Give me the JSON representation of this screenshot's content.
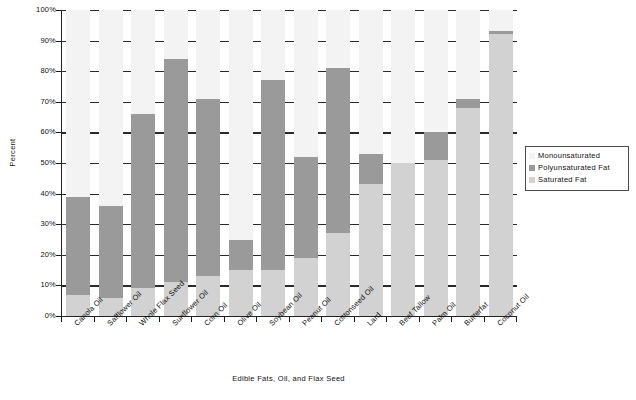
{
  "chart_data": {
    "type": "bar",
    "subtype": "stacked-column",
    "title": "",
    "xlabel": "Edible Fats, Oil, and Flax Seed",
    "ylabel": "Percent",
    "ylim": [
      0,
      100
    ],
    "ytick_labels": [
      "0%",
      "10%",
      "20%",
      "30%",
      "40%",
      "50%",
      "60%",
      "70%",
      "80%",
      "90%",
      "100%"
    ],
    "ytick_values": [
      0,
      10,
      20,
      30,
      40,
      50,
      60,
      70,
      80,
      90,
      100
    ],
    "grid": true,
    "legend_position": "right",
    "categories": [
      "Canola Oil",
      "Safflower Oil",
      "Whole Flax Seed",
      "Sunflower Oil",
      "Corn Oil",
      "Olive Oil",
      "Soybean Oil",
      "Peanut Oil",
      "Cottonseed Oil",
      "Lard",
      "Beef Tallow",
      "Palm Oil",
      "Butterfat",
      "Coconut Oil"
    ],
    "series": [
      {
        "name": "Saturated Fat",
        "color": "#d2d2d2",
        "values": [
          7,
          6,
          9,
          11,
          13,
          15,
          15,
          19,
          27,
          43,
          50,
          51,
          68,
          92
        ]
      },
      {
        "name": "Polyunsaturated Fat",
        "color": "#9a9a9a",
        "values": [
          32,
          30,
          57,
          73,
          58,
          10,
          62,
          33,
          54,
          10,
          0,
          9,
          3,
          1
        ]
      },
      {
        "name": "Monounsaturated",
        "color": "#f3f3f3",
        "values": [
          61,
          64,
          34,
          16,
          29,
          75,
          23,
          48,
          19,
          47,
          50,
          40,
          29,
          7
        ]
      }
    ],
    "cumulative_tops": {
      "saturated": [
        7,
        6,
        9,
        11,
        13,
        15,
        15,
        19,
        27,
        43,
        50,
        51,
        68,
        92
      ],
      "saturated_plus_poly": [
        39,
        36,
        66,
        84,
        71,
        25,
        77,
        52,
        81,
        53,
        50,
        60,
        71,
        93
      ]
    }
  },
  "legend": {
    "items": [
      {
        "label": "Monounsaturated",
        "color": "#f3f3f3"
      },
      {
        "label": "Polyunsaturated Fat",
        "color": "#9a9a9a"
      },
      {
        "label": "Saturated Fat",
        "color": "#d2d2d2"
      }
    ]
  },
  "colors": {
    "plot_background": "#ffffff",
    "gridline": "#2a2a2a",
    "axis": "#222222",
    "text": "#111111"
  }
}
